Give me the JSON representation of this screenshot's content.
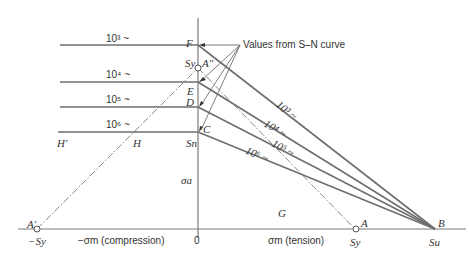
{
  "diagram": {
    "type": "goodman-diagram",
    "annotation": "Values from S–N curve",
    "lines_life_labels": [
      "10³ ~",
      "10⁴ ~",
      "10⁵ ~",
      "10⁶ ~"
    ],
    "points": {
      "F": "F",
      "E": "E",
      "D": "D",
      "C": "C",
      "A_double_prime": "A″",
      "A_prime": "A′",
      "A": "A",
      "B": "B",
      "G": "G",
      "H": "H",
      "H_prime": "H′"
    },
    "axis_labels": {
      "sigma_a": "σa",
      "origin": "0",
      "neg_sigma_m": "−σm (compression)",
      "pos_sigma_m": "σm (tension)",
      "neg_Sy": "−Sy",
      "Sy_axis": "Sy",
      "Sy_vertical": "Sy",
      "Sn": "Sn",
      "Su": "Su"
    },
    "colors": {
      "line": "#6e6e6e",
      "text": "#333333"
    }
  }
}
